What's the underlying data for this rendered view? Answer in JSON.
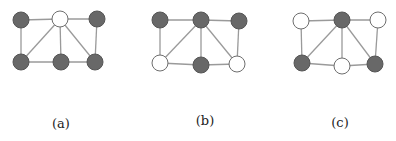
{
  "figure": {
    "colors": {
      "dark_node": "#686868",
      "light_node": "#ffffff",
      "edge": "#9a9a9a",
      "label": "#222222"
    },
    "panels": [
      {
        "label": "(a)",
        "label_pos": [
          61,
          124
        ],
        "nodes": [
          {
            "id": "tl",
            "x": 21,
            "y": 20,
            "fill": "dark"
          },
          {
            "id": "tm",
            "x": 60,
            "y": 19,
            "fill": "light"
          },
          {
            "id": "tr",
            "x": 97,
            "y": 19,
            "fill": "dark"
          },
          {
            "id": "bl",
            "x": 21,
            "y": 62,
            "fill": "dark"
          },
          {
            "id": "bm",
            "x": 61,
            "y": 62,
            "fill": "dark"
          },
          {
            "id": "br",
            "x": 95,
            "y": 62,
            "fill": "dark"
          }
        ]
      },
      {
        "label": "(b)",
        "label_pos": [
          205,
          121
        ],
        "nodes": [
          {
            "id": "tl",
            "x": 160,
            "y": 20,
            "fill": "dark"
          },
          {
            "id": "tm",
            "x": 201,
            "y": 20,
            "fill": "dark"
          },
          {
            "id": "tr",
            "x": 239,
            "y": 21,
            "fill": "dark"
          },
          {
            "id": "bl",
            "x": 160,
            "y": 63,
            "fill": "light"
          },
          {
            "id": "bm",
            "x": 201,
            "y": 65,
            "fill": "dark"
          },
          {
            "id": "br",
            "x": 237,
            "y": 64,
            "fill": "light"
          }
        ]
      },
      {
        "label": "(c)",
        "label_pos": [
          340,
          123
        ],
        "nodes": [
          {
            "id": "tl",
            "x": 301,
            "y": 21,
            "fill": "light"
          },
          {
            "id": "tm",
            "x": 342,
            "y": 20,
            "fill": "dark"
          },
          {
            "id": "tr",
            "x": 378,
            "y": 20,
            "fill": "light"
          },
          {
            "id": "bl",
            "x": 302,
            "y": 63,
            "fill": "dark"
          },
          {
            "id": "bm",
            "x": 342,
            "y": 66,
            "fill": "light"
          },
          {
            "id": "br",
            "x": 375,
            "y": 64,
            "fill": "dark"
          }
        ]
      }
    ],
    "edges": [
      [
        "tl",
        "tm"
      ],
      [
        "tm",
        "tr"
      ],
      [
        "tl",
        "bl"
      ],
      [
        "tr",
        "br"
      ],
      [
        "bl",
        "bm"
      ],
      [
        "bm",
        "br"
      ],
      [
        "tm",
        "bl"
      ],
      [
        "tm",
        "bm"
      ],
      [
        "tm",
        "br"
      ]
    ],
    "node_radius": 8
  }
}
